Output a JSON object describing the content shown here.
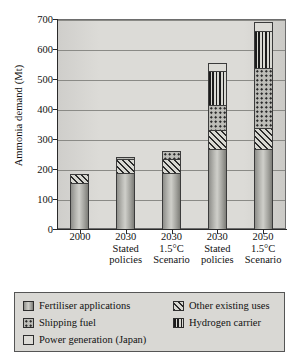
{
  "chart_data": {
    "type": "bar",
    "stacked": true,
    "title": "",
    "xlabel": "",
    "ylabel": "Ammonia demand (Mt)",
    "ylim": [
      0,
      700
    ],
    "ytick_labels": [
      "0",
      "100",
      "200",
      "300",
      "400",
      "500",
      "600",
      "700"
    ],
    "ytick_values": [
      0,
      100,
      200,
      300,
      400,
      500,
      600,
      700
    ],
    "grid": true,
    "legend_position": "below-plot",
    "categories": [
      {
        "line1": "2000",
        "line2": "",
        "line3": ""
      },
      {
        "line1": "2030",
        "line2": "Stated",
        "line3": "policies"
      },
      {
        "line1": "2030",
        "line2": "1.5°C",
        "line3": "Scenario"
      },
      {
        "line1": "2030",
        "line2": "Stated",
        "line3": "policies"
      },
      {
        "line1": "2050",
        "line2": "1.5°C",
        "line3": "Scenario"
      }
    ],
    "series": [
      {
        "name": "Fertiliser applications",
        "key": "fert",
        "values": [
          155,
          188,
          188,
          268,
          268
        ]
      },
      {
        "name": "Other existing uses",
        "key": "other",
        "values": [
          30,
          45,
          45,
          63,
          70
        ]
      },
      {
        "name": "Shipping fuel",
        "key": "ship",
        "values": [
          0,
          8,
          28,
          83,
          198
        ]
      },
      {
        "name": "Hydrogen carrier",
        "key": "h2",
        "values": [
          0,
          0,
          0,
          113,
          125
        ]
      },
      {
        "name": "Power generation (Japan)",
        "key": "power",
        "values": [
          0,
          0,
          0,
          28,
          30
        ]
      }
    ],
    "totals": [
      185,
      241,
      261,
      555,
      691
    ]
  },
  "legend": {
    "entries": [
      {
        "label": "Fertiliser applications",
        "key": "fert"
      },
      {
        "label": "Other existing uses",
        "key": "other"
      },
      {
        "label": "Shipping fuel",
        "key": "ship"
      },
      {
        "label": "Hydrogen carrier",
        "key": "h2"
      },
      {
        "label": "Power generation (Japan)",
        "key": "power"
      }
    ]
  },
  "colors": {
    "plot_background": "#dcdbd7",
    "legend_background": "#d9d8d4",
    "axis": "#2a2a2a",
    "gridline": "#8a8a86",
    "bar_outline": "#3b3b3b"
  }
}
